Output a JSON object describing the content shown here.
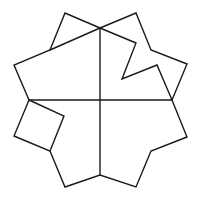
{
  "diagram": {
    "width": 204,
    "height": 200,
    "stroke_color": "#1a1a1a",
    "background": "#ffffff",
    "outline": [
      [
        100,
        28
      ],
      [
        65,
        13
      ],
      [
        50,
        50
      ],
      [
        14,
        65
      ],
      [
        29,
        100
      ],
      [
        14,
        136
      ],
      [
        50,
        151
      ],
      [
        65,
        187
      ],
      [
        100,
        175
      ],
      [
        136,
        187
      ],
      [
        151,
        151
      ],
      [
        187,
        137
      ],
      [
        172,
        100
      ],
      [
        187,
        64
      ],
      [
        151,
        50
      ],
      [
        136,
        13
      ],
      [
        100,
        28
      ]
    ],
    "segments": [
      {
        "name": "vertical-axis",
        "points": [
          [
            100,
            28
          ],
          [
            100,
            175
          ]
        ]
      },
      {
        "name": "horizontal-axis",
        "points": [
          [
            29,
            100
          ],
          [
            172,
            100
          ]
        ]
      },
      {
        "name": "top-left-diagonal",
        "points": [
          [
            100,
            28
          ],
          [
            50,
            50
          ]
        ]
      },
      {
        "name": "top-right-notch",
        "points": [
          [
            100,
            28
          ],
          [
            136,
            43
          ],
          [
            122,
            79
          ],
          [
            157,
            65
          ],
          [
            172,
            100
          ]
        ]
      },
      {
        "name": "bottom-left-square",
        "points": [
          [
            29,
            100
          ],
          [
            64,
            116
          ],
          [
            50,
            151
          ]
        ]
      }
    ]
  }
}
